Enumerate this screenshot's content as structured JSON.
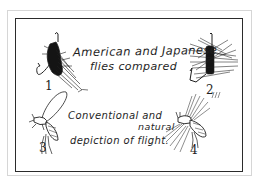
{
  "figure": {
    "title_lines": [
      "American and Japanese",
      "flies compared"
    ],
    "subtitle_lines": [
      "Conventional and",
      "natural",
      "depiction of flight."
    ],
    "panels": [
      {
        "number": "1",
        "subject": "american-fly",
        "description": "American fly with dark hackle and hook"
      },
      {
        "number": "2",
        "subject": "japanese-fly",
        "description": "Japanese fly with stiff radiating hackle and hook"
      },
      {
        "number": "3",
        "subject": "conventional-flight",
        "description": "Insect with single upright wing (conventional depiction)"
      },
      {
        "number": "4",
        "subject": "natural-flight",
        "description": "Insect with blurred wing strokes (natural depiction)"
      }
    ],
    "colors": {
      "ink": "#1e1e1e",
      "frame": "#2b2b2b",
      "outer_border": "#d6d6d6",
      "paper": "#ffffff"
    }
  }
}
